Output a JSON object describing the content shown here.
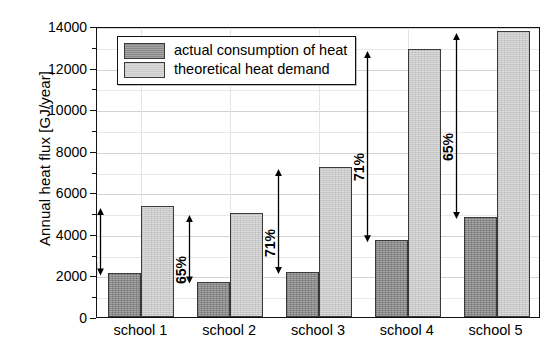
{
  "chart_data": {
    "type": "bar",
    "title": "",
    "xlabel": "",
    "ylabel": "Annual heat flux [GJ/year]",
    "categories": [
      "school 1",
      "school 2",
      "school 3",
      "school 4",
      "school 5"
    ],
    "series": [
      {
        "name": "actual consumption of heat",
        "color": "#8a8a8a",
        "values": [
          2100,
          1700,
          2150,
          3700,
          4800
        ]
      },
      {
        "name": "theoretical heat demand",
        "color": "#c9c9c9",
        "values": [
          5350,
          5000,
          7200,
          12900,
          13750
        ]
      }
    ],
    "annotations": [
      {
        "category": "school 1",
        "text": "61%",
        "from": 2100,
        "to": 5350
      },
      {
        "category": "school 2",
        "text": "65%",
        "from": 1700,
        "to": 5000
      },
      {
        "category": "school 3",
        "text": "71%",
        "from": 2150,
        "to": 7200
      },
      {
        "category": "school 4",
        "text": "71%",
        "from": 3700,
        "to": 12900
      },
      {
        "category": "school 5",
        "text": "65%",
        "from": 4800,
        "to": 13750
      }
    ],
    "ylim": [
      0,
      14000
    ],
    "yticks": [
      0,
      2000,
      4000,
      6000,
      8000,
      10000,
      12000,
      14000
    ],
    "ytick_labels": [
      "0",
      "2000",
      "4000",
      "6000",
      "8000",
      "10000",
      "12000",
      "14000"
    ],
    "yminor_step": 1000,
    "grid": true,
    "legend_position": "top-left"
  },
  "legend": {
    "items": [
      {
        "label": "actual consumption of heat",
        "swatch": "actual"
      },
      {
        "label": "theoretical heat demand",
        "swatch": "theoretical"
      }
    ]
  }
}
